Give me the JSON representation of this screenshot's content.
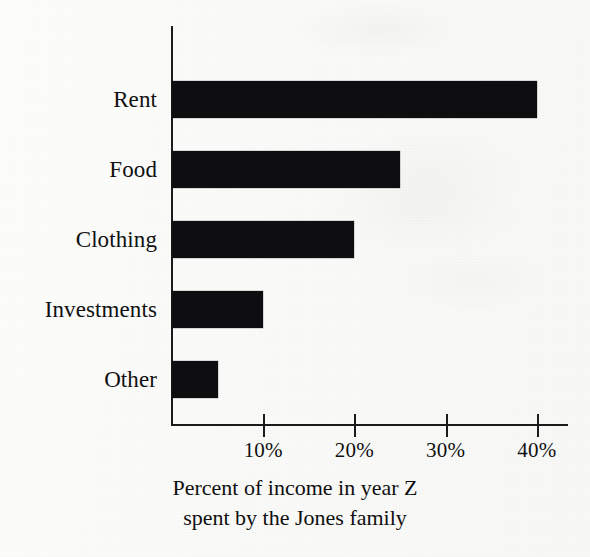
{
  "chart_data": {
    "type": "bar",
    "orientation": "horizontal",
    "title": "",
    "subtitle": "",
    "xlabel": "Percent of income in year Z spent by the Jones family",
    "ylabel": "",
    "categories": [
      "Rent",
      "Food",
      "Clothing",
      "Investments",
      "Other"
    ],
    "values": [
      40,
      25,
      20,
      10,
      5
    ],
    "series": [
      {
        "name": "Percent of income",
        "values": [
          40,
          25,
          20,
          10,
          5
        ]
      }
    ],
    "xlim": [
      0,
      44
    ],
    "ylim": null,
    "x_ticks": [
      10,
      20,
      30,
      40
    ],
    "x_tick_labels": [
      "10%",
      "20%",
      "30%",
      "40%"
    ],
    "grid": false,
    "legend": false,
    "legend_position": "none",
    "bar_color": "#0e0e10",
    "axis_color": "#1b1b1b",
    "background_color": "#fbfbfa"
  },
  "caption": {
    "line1": "Percent of income in year Z",
    "line2": "spent by the Jones family"
  }
}
